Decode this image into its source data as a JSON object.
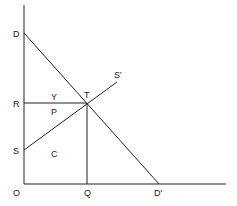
{
  "diagram": {
    "type": "supply-demand",
    "colors": {
      "line": "#222222",
      "background": "#ffffff"
    },
    "axes": {
      "origin": {
        "label": "O",
        "x": 24,
        "y": 184
      },
      "y_axis": {
        "x1": 24,
        "y1": 5,
        "x2": 24,
        "y2": 184
      },
      "x_axis": {
        "x1": 24,
        "y1": 184,
        "x2": 226,
        "y2": 184
      }
    },
    "lines": {
      "demand": {
        "from": "D",
        "to": "D'",
        "x1": 24,
        "y1": 33,
        "x2": 159,
        "y2": 184
      },
      "supply": {
        "from": "S",
        "to": "S'",
        "x1": 24,
        "y1": 150,
        "x2": 117,
        "y2": 82
      },
      "price_line": {
        "from": "R",
        "to": "T",
        "x1": 24,
        "y1": 103,
        "x2": 87,
        "y2": 103
      },
      "quantity_line": {
        "from": "T",
        "to": "Q",
        "x1": 87,
        "y1": 103,
        "x2": 87,
        "y2": 184
      }
    },
    "labels": {
      "D": {
        "text": "D",
        "x": 13,
        "y": 37
      },
      "R": {
        "text": "R",
        "x": 13,
        "y": 107
      },
      "S": {
        "text": "S",
        "x": 13,
        "y": 154
      },
      "O": {
        "text": "O",
        "x": 13,
        "y": 196
      },
      "Q": {
        "text": "Q",
        "x": 84,
        "y": 196
      },
      "D_prime": {
        "text": "D'",
        "x": 154,
        "y": 196
      },
      "T": {
        "text": "T",
        "x": 84,
        "y": 98
      },
      "S_prime": {
        "text": "S'",
        "x": 114,
        "y": 78
      },
      "Y": {
        "text": "Y",
        "x": 51,
        "y": 100
      },
      "P": {
        "text": "P",
        "x": 51,
        "y": 115
      },
      "C": {
        "text": "C",
        "x": 51,
        "y": 157
      }
    }
  }
}
